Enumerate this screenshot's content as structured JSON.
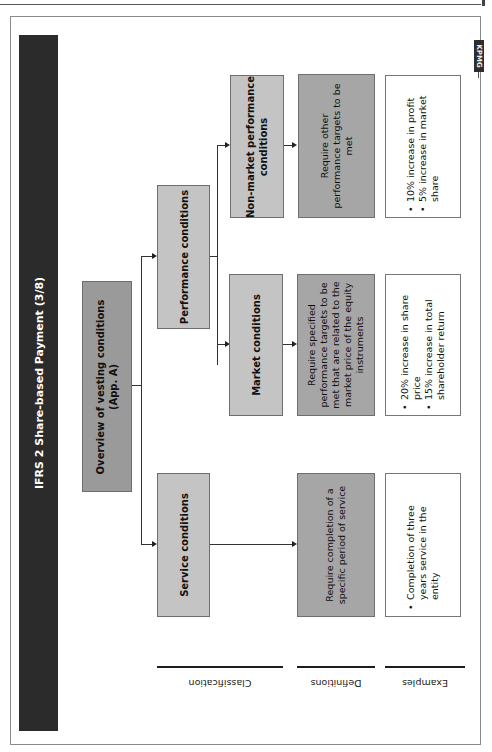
{
  "page": {
    "title": "IFRS 2 Share-based Payment (3/8)",
    "logo": "KPMG"
  },
  "diagram": {
    "root": "Overview of vesting conditions (App. A)",
    "root_line1": "Overview of vesting conditions",
    "root_line2": "(App. A)",
    "level1": {
      "performance": "Performance conditions",
      "service": "Service conditions"
    },
    "level2": {
      "non_market_line1": "Non-market performance",
      "non_market_line2": "conditions",
      "market": "Market conditions"
    },
    "definitions": {
      "non_market": [
        "Require other",
        "performance targets to be",
        "met"
      ],
      "market": [
        "Require specified",
        "performance targets to be",
        "met that are related to the",
        "market price of the equity",
        "instruments"
      ],
      "service": [
        "Require completion of a",
        "specific period of service"
      ]
    },
    "examples": {
      "non_market": [
        "10% increase in profit",
        "5% increase in market share"
      ],
      "market": [
        "20% increase in share price",
        "15% increase in total shareholder return"
      ],
      "service": [
        "Completion of three years service in the entity"
      ]
    }
  },
  "row_labels": {
    "classification": "Classification",
    "definitions": "Definitions",
    "examples": "Examples"
  },
  "colors": {
    "title_bar": "#2b2b2b",
    "root_box": "#9a9a9a",
    "classification_box": "#c4c4c4",
    "definition_box": "#a6a6a6",
    "example_box": "#ffffff"
  }
}
